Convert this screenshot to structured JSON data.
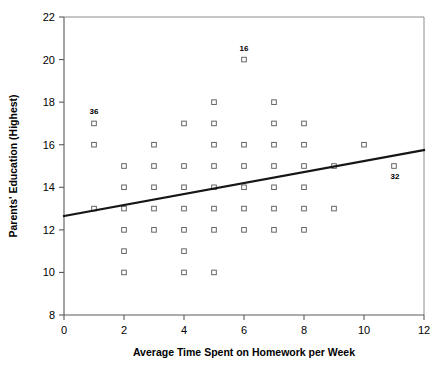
{
  "chart_data": {
    "type": "scatter",
    "title": "",
    "xlabel": "Average Time Spent on Homework per Week",
    "ylabel": "Parents' Education (Highest)",
    "xlim": [
      0,
      12
    ],
    "ylim": [
      8,
      22
    ],
    "xticks": [
      0,
      2,
      4,
      6,
      8,
      10,
      12
    ],
    "yticks": [
      8,
      10,
      12,
      14,
      16,
      18,
      20,
      22
    ],
    "grid": false,
    "legend": "none",
    "points": [
      {
        "x": 1,
        "y": 17
      },
      {
        "x": 1,
        "y": 16
      },
      {
        "x": 1,
        "y": 13
      },
      {
        "x": 2,
        "y": 15
      },
      {
        "x": 2,
        "y": 14
      },
      {
        "x": 2,
        "y": 13
      },
      {
        "x": 2,
        "y": 12
      },
      {
        "x": 2,
        "y": 11
      },
      {
        "x": 2,
        "y": 10
      },
      {
        "x": 3,
        "y": 16
      },
      {
        "x": 3,
        "y": 15
      },
      {
        "x": 3,
        "y": 14
      },
      {
        "x": 3,
        "y": 13
      },
      {
        "x": 3,
        "y": 12
      },
      {
        "x": 4,
        "y": 17
      },
      {
        "x": 4,
        "y": 15
      },
      {
        "x": 4,
        "y": 14
      },
      {
        "x": 4,
        "y": 13
      },
      {
        "x": 4,
        "y": 12
      },
      {
        "x": 4,
        "y": 11
      },
      {
        "x": 4,
        "y": 10
      },
      {
        "x": 5,
        "y": 18
      },
      {
        "x": 5,
        "y": 17
      },
      {
        "x": 5,
        "y": 16
      },
      {
        "x": 5,
        "y": 15
      },
      {
        "x": 5,
        "y": 14
      },
      {
        "x": 5,
        "y": 13
      },
      {
        "x": 5,
        "y": 12
      },
      {
        "x": 5,
        "y": 10
      },
      {
        "x": 6,
        "y": 20
      },
      {
        "x": 6,
        "y": 16
      },
      {
        "x": 6,
        "y": 15
      },
      {
        "x": 6,
        "y": 14
      },
      {
        "x": 6,
        "y": 13
      },
      {
        "x": 6,
        "y": 12
      },
      {
        "x": 7,
        "y": 18
      },
      {
        "x": 7,
        "y": 17
      },
      {
        "x": 7,
        "y": 16
      },
      {
        "x": 7,
        "y": 15
      },
      {
        "x": 7,
        "y": 14
      },
      {
        "x": 7,
        "y": 13
      },
      {
        "x": 7,
        "y": 12
      },
      {
        "x": 8,
        "y": 17
      },
      {
        "x": 8,
        "y": 16
      },
      {
        "x": 8,
        "y": 15
      },
      {
        "x": 8,
        "y": 14
      },
      {
        "x": 8,
        "y": 13
      },
      {
        "x": 8,
        "y": 12
      },
      {
        "x": 9,
        "y": 15
      },
      {
        "x": 9,
        "y": 13
      },
      {
        "x": 10,
        "y": 16
      },
      {
        "x": 11,
        "y": 15
      }
    ],
    "annotations": [
      {
        "label": "36",
        "x": 1,
        "y": 17,
        "dx": 0,
        "dy": -9,
        "anchor": "middle"
      },
      {
        "label": "16",
        "x": 6,
        "y": 20,
        "dx": 0,
        "dy": -9,
        "anchor": "middle"
      },
      {
        "label": "32",
        "x": 11,
        "y": 15,
        "dx": 1,
        "dy": 13,
        "anchor": "middle"
      }
    ],
    "trendline": {
      "x0": 0,
      "y0": 12.65,
      "x1": 12,
      "y1": 15.75,
      "color": "#161616"
    }
  },
  "axes": {
    "x_tick_labels": [
      "0",
      "2",
      "4",
      "6",
      "8",
      "10",
      "12"
    ],
    "y_tick_labels": [
      "8",
      "10",
      "12",
      "14",
      "16",
      "18",
      "20",
      "22"
    ],
    "x_axis_title": "Average Time Spent on Homework per Week",
    "y_axis_title": "Parents' Education (Highest)"
  },
  "colors": {
    "background": "#ffffff",
    "axis": "#5a5a5a",
    "frame": "#8c8c8c",
    "marker_stroke": "#555555",
    "marker_fill": "#ffffff",
    "trend": "#161616",
    "text": "#000000"
  }
}
